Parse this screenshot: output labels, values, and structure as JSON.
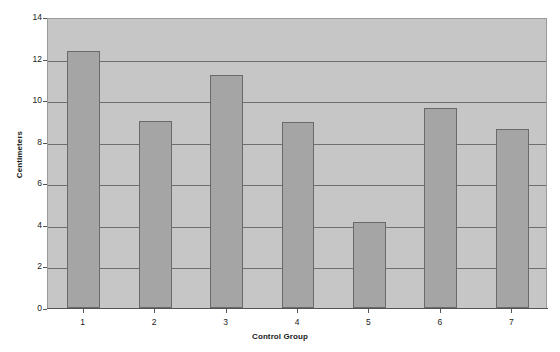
{
  "chart_data": {
    "type": "bar",
    "title": "",
    "xlabel": "Control Group",
    "ylabel": "Centimeters",
    "categories": [
      "1",
      "2",
      "3",
      "4",
      "5",
      "6",
      "7"
    ],
    "values": [
      12.35,
      9.0,
      11.2,
      8.95,
      4.15,
      9.6,
      8.6
    ],
    "series": [
      {
        "name": "Centimeters",
        "values": [
          12.35,
          9.0,
          11.2,
          8.95,
          4.15,
          9.6,
          8.6
        ]
      }
    ],
    "ylim": [
      0,
      14
    ],
    "yticks": [
      0,
      2,
      4,
      6,
      8,
      10,
      12,
      14
    ],
    "ytick_labels": [
      "0",
      "2",
      "4",
      "6",
      "8",
      "10",
      "12",
      "14"
    ],
    "grid": "horizontal",
    "legend": "none",
    "colors": {
      "bar_fill": "#a5a5a5",
      "bar_border": "#6a6a6a",
      "plot_background": "#c6c6c6",
      "gridline": "#6e6e6e",
      "axis": "#555555",
      "text": "#1a1a1a",
      "page_background": "#ffffff"
    }
  }
}
